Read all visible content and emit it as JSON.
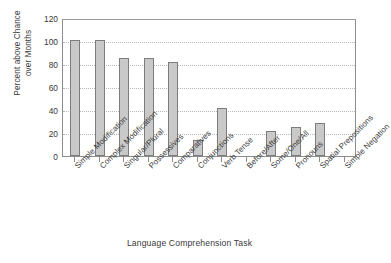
{
  "chart_data": {
    "type": "bar",
    "title": "",
    "xlabel": "Language Comprehension Task",
    "ylabel": "Percent above Chance\nover Months",
    "ylim": [
      0,
      120
    ],
    "yticks": [
      0,
      20,
      40,
      60,
      80,
      100,
      120
    ],
    "grid": true,
    "legend": "none",
    "categories": [
      "Simple Modification",
      "Complex Modification",
      "Singular/Plural",
      "Possessives",
      "Comparatives",
      "Conjunctions",
      "Verb Tense",
      "Before/After",
      "Some/One/All",
      "Pronouns",
      "Spatial Prepositions",
      "Simple Negation"
    ],
    "values": [
      101,
      101,
      85,
      85,
      82,
      14,
      42,
      0,
      22,
      25,
      29,
      0
    ],
    "bar_color": "#c9c9c9",
    "bar_edge_color": "#7d7d7d",
    "gridline_color": "#b9b9b9",
    "axis_color": "#8d8d8d",
    "text_color": "#3a3a3a"
  }
}
